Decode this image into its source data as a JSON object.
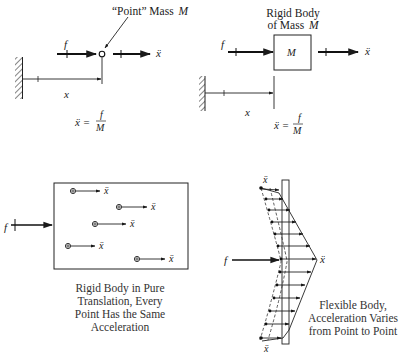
{
  "panels": {
    "point_mass": {
      "title": "“Point” Mass",
      "title_symbol": "M",
      "force_label": "f",
      "accel_label": "ẍ",
      "position_label": "x",
      "equation_lhs": "ẍ =",
      "equation_num": "f",
      "equation_den": "M"
    },
    "rigid_body": {
      "title_line1": "Rigid Body",
      "title_line2": "of Mass",
      "title_symbol": "M",
      "box_label": "M",
      "force_label": "f",
      "accel_label": "ẍ",
      "position_label": "x",
      "equation_lhs": "ẍ =",
      "equation_num": "f",
      "equation_den": "M"
    },
    "pure_translation": {
      "force_label": "f",
      "particle_accel_label": "ẍ",
      "caption_lines": [
        "Rigid Body in Pure",
        "Translation, Every",
        "Point Has the Same",
        "Acceleration"
      ]
    },
    "flexible_body": {
      "force_label": "f",
      "accel_label": "ẍ",
      "caption_lines": [
        "Flexible Body,",
        "Acceleration Varies",
        "from Point to Point"
      ]
    }
  },
  "colors": {
    "ink": "#1a1a1a",
    "background": "#ffffff"
  }
}
